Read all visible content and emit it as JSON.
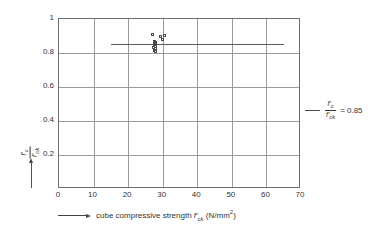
{
  "chart_data": {
    "type": "scatter",
    "title": "",
    "xlabel": "cube compressive strength f'ck (N/mm2)",
    "ylabel": "f'c / f'ck",
    "xlim": [
      0,
      70
    ],
    "ylim": [
      0,
      1
    ],
    "grid": true,
    "xticks": [
      0,
      10,
      20,
      30,
      40,
      50,
      60,
      70
    ],
    "yticks": [
      0.2,
      0.4,
      0.6,
      0.8,
      1
    ],
    "xtick_labels": [
      "0",
      "10",
      "20",
      "30",
      "40",
      "50",
      "60",
      "70"
    ],
    "ytick_labels": [
      "0.2",
      "0.4",
      "0.6",
      "0.8",
      "1"
    ],
    "legend_position": "right",
    "series": [
      {
        "name": "reference line",
        "type": "line",
        "value": 0.85,
        "x_start": 15,
        "x_end": 65,
        "color": "#5a5a5a"
      },
      {
        "name": "test data",
        "type": "scatter",
        "marker": "open-square",
        "color": "#4a4a4a",
        "points": [
          [
            27.3,
            0.905
          ],
          [
            29.6,
            0.893
          ],
          [
            30.6,
            0.898
          ],
          [
            30.1,
            0.878
          ],
          [
            27.9,
            0.862
          ],
          [
            28.1,
            0.858
          ],
          [
            27.7,
            0.852
          ],
          [
            28.2,
            0.848
          ],
          [
            27.8,
            0.843
          ],
          [
            28.0,
            0.838
          ],
          [
            27.6,
            0.828
          ],
          [
            28.1,
            0.822
          ],
          [
            27.9,
            0.812
          ],
          [
            28.0,
            0.806
          ]
        ]
      }
    ]
  },
  "axes": {
    "x_caption_prefix": "cube compressive strength",
    "x_symbol_main": "f",
    "x_symbol_prime": "'",
    "x_symbol_sub": "ck",
    "x_units_open": "(N/mm",
    "x_units_sup": "2",
    "x_units_close": ")",
    "y_symbol_num_main": "f",
    "y_symbol_num_prime": "'",
    "y_symbol_num_sub": "c",
    "y_symbol_den_main": "f",
    "y_symbol_den_prime": "'",
    "y_symbol_den_sub": "ck"
  },
  "legend": {
    "num_main": "f",
    "num_prime": "'",
    "num_sub": "c",
    "den_main": "f",
    "den_prime": "'",
    "den_sub": "ck",
    "equals": "=",
    "value": "0.85"
  },
  "colors": {
    "frame": "#6e6e6e",
    "grid": "#9a9a9a",
    "line": "#5a5a5a",
    "marker": "#4a4a4a",
    "text": "#333333",
    "background": "#ffffff"
  }
}
